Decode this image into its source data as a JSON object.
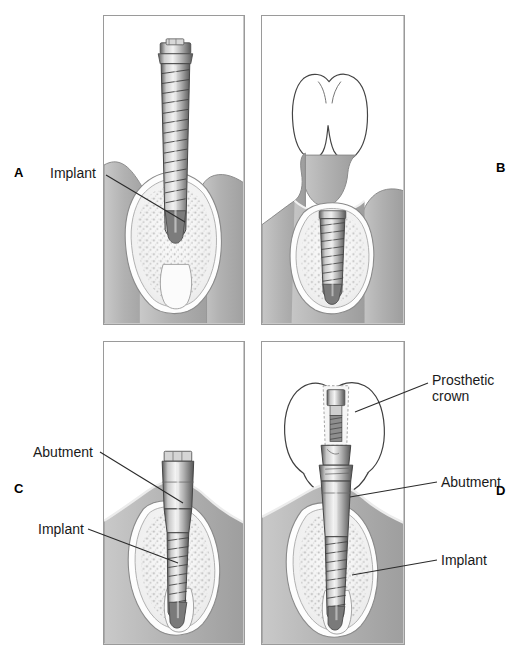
{
  "figure": {
    "type": "medical-illustration",
    "panel_count": 4
  },
  "panels": [
    {
      "id": "A",
      "letter": "A",
      "description": "Implant placed in bone socket, surgical stage one",
      "annotations": [
        {
          "text": "Implant",
          "target": "implant-body"
        }
      ]
    },
    {
      "id": "B",
      "letter": "B",
      "description": "Implant submerged beneath gingival tissue during osseointegration, adjacent natural tooth shown",
      "annotations": []
    },
    {
      "id": "C",
      "letter": "C",
      "description": "Abutment connected to implant, emerging through gingiva",
      "annotations": [
        {
          "text": "Abutment",
          "target": "abutment-body"
        },
        {
          "text": "Implant",
          "target": "implant-body"
        }
      ]
    },
    {
      "id": "D",
      "letter": "D",
      "description": "Completed restoration with prosthetic crown seated on abutment",
      "annotations": [
        {
          "text": "Prosthetic\ncrown",
          "target": "crown-body"
        },
        {
          "text": "Abutment",
          "target": "abutment-body"
        },
        {
          "text": "Implant",
          "target": "implant-body"
        }
      ]
    }
  ],
  "labels": {
    "implant": "Implant",
    "abutment": "Abutment",
    "prosthetic_crown_line1": "Prosthetic",
    "prosthetic_crown_line2": "crown",
    "panel_a": "A",
    "panel_b": "B",
    "panel_c": "C",
    "panel_d": "D"
  },
  "colors": {
    "background": "#ffffff",
    "frame_border": "#9a9a9a",
    "gingiva": "#b5b5b5",
    "gingiva_dark": "#9e9e9e",
    "bone_cortical": "#e8e8e8",
    "bone_trabecular": "#f4f4f4",
    "metal_light": "#e0e0e0",
    "metal_mid": "#a8a8a8",
    "metal_dark": "#6e6e6e",
    "outline": "#3a3a3a",
    "text": "#1a1a1a",
    "leader_line": "#2b2b2b"
  }
}
